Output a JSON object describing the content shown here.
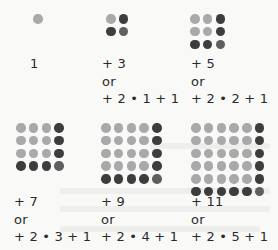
{
  "figure": {
    "items": [
      {
        "n": 1,
        "expr": "1",
        "or": "",
        "alt": ""
      },
      {
        "n": 2,
        "expr": "+ 3",
        "or": "or",
        "alt": "+ 2 • 1 + 1"
      },
      {
        "n": 3,
        "expr": "+ 5",
        "or": "or",
        "alt": "+ 2 • 2 + 1"
      },
      {
        "n": 4,
        "expr": "+ 7",
        "or": "or",
        "alt": "+ 2 • 3 + 1"
      },
      {
        "n": 5,
        "expr": "+ 9",
        "or": "or",
        "alt": "+ 2 • 4 + 1"
      },
      {
        "n": 6,
        "expr": "+ 11",
        "or": "or",
        "alt": "+ 2 • 5 + 1"
      }
    ]
  },
  "colors": {
    "inner_dot": "#a9a9a9",
    "edge_dot": "#3d3d3d",
    "corner_dot": "#5f5f5f",
    "background": "#f9f9f8",
    "text": "#2a2a2a"
  }
}
